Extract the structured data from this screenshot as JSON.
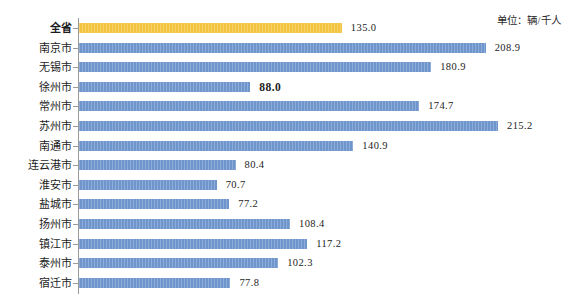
{
  "unit_caption": "单位：辆/千人",
  "chart_data": {
    "type": "bar",
    "orientation": "horizontal",
    "title": "",
    "subtitle": "",
    "xlabel": "",
    "ylabel": "",
    "unit": "辆/千人",
    "grid": false,
    "legend": false,
    "xlim": [
      0,
      215.2
    ],
    "categories": [
      "全省",
      "南京市",
      "无锡市",
      "徐州市",
      "常州市",
      "苏州市",
      "南通市",
      "连云港市",
      "淮安市",
      "盐城市",
      "扬州市",
      "镇江市",
      "泰州市",
      "宿迁市"
    ],
    "values": [
      135.0,
      208.9,
      180.9,
      88.0,
      174.7,
      215.2,
      140.9,
      80.4,
      70.7,
      77.2,
      108.4,
      117.2,
      102.3,
      77.8
    ],
    "value_labels": [
      "135.0",
      "208.9",
      "180.9",
      "88.0",
      "174.7",
      "215.2",
      "140.9",
      "80.4",
      "70.7",
      "77.2",
      "108.4",
      "117.2",
      "102.3",
      "77.8"
    ],
    "emphasized_index": 3,
    "total_index": 0,
    "colors": {
      "bar": "#6f95cd",
      "total_bar": "#f3c43f",
      "axis": "#9a9a9a",
      "text": "#1d1d1d",
      "background": "#ffffff"
    }
  }
}
